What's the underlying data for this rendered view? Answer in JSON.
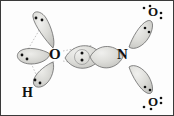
{
  "figure": {
    "kind": "orbital-overlap-diagram",
    "molecule": "HNO3",
    "background_color": "#fdfdfd",
    "border_color": "#3a3a3a",
    "lobe_fill": "#d8d8d4",
    "lobe_stroke": "#5a5a5a",
    "dot_color": "#111111",
    "guide_line_color": "#9a9a9a"
  },
  "atoms": [
    {
      "id": "oxygen-hydroxyl",
      "symbol": "O",
      "x": 55,
      "y": 54,
      "size": 15
    },
    {
      "id": "hydrogen",
      "symbol": "H",
      "x": 27,
      "y": 93,
      "size": 14
    },
    {
      "id": "nitrogen",
      "symbol": "N",
      "x": 121,
      "y": 51,
      "size": 15
    },
    {
      "id": "oxygen-top",
      "symbol": "O",
      "x": 150,
      "y": 10,
      "size": 13
    },
    {
      "id": "oxygen-bottom",
      "symbol": "O",
      "x": 150,
      "y": 94,
      "size": 13
    }
  ],
  "lobes": [
    {
      "id": "lobe-hydroxyl-upper",
      "label": "upper lone-pair lobe on hydroxyl oxygen"
    },
    {
      "id": "lobe-hydroxyl-left",
      "label": "left lone-pair lobe on hydroxyl oxygen"
    },
    {
      "id": "lobe-oh-bond",
      "label": "O-H bonding lobe"
    },
    {
      "id": "lobe-on-bond-left",
      "label": "O side of O-N sigma overlap"
    },
    {
      "id": "lobe-on-bond-right",
      "label": "N side of O-N sigma overlap"
    },
    {
      "id": "lobe-n-o-top",
      "label": "N to top oxygen bonding lobe"
    },
    {
      "id": "lobe-n-o-bottom",
      "label": "N to bottom oxygen bonding lobe"
    }
  ],
  "electron_pairs": [
    {
      "id": "pair-center-sigma",
      "location": "O-N sigma overlap center",
      "count": 2
    },
    {
      "id": "pair-hydroxyl-upper-lobe",
      "location": "upper lobe of hydroxyl oxygen",
      "count": 2
    },
    {
      "id": "pair-hydroxyl-left-lobe",
      "location": "left lobe of hydroxyl oxygen",
      "count": 2
    },
    {
      "id": "pair-oh-lobe",
      "location": "O-H bonding lobe",
      "count": 2
    },
    {
      "id": "pair-top-o-above",
      "location": "above top oxygen",
      "count": 2
    },
    {
      "id": "pair-top-o-right",
      "location": "right of top oxygen",
      "count": 2
    },
    {
      "id": "pair-top-o-lobe",
      "location": "top oxygen bonding lobe",
      "count": 2
    },
    {
      "id": "pair-bottom-o-below",
      "location": "below bottom oxygen",
      "count": 2
    },
    {
      "id": "pair-bottom-o-right",
      "location": "right of bottom oxygen",
      "count": 2
    },
    {
      "id": "pair-bottom-o-lobe",
      "location": "bottom oxygen bonding lobe",
      "count": 2
    }
  ],
  "guide_lines": [
    {
      "id": "guide-o-to-upper-lobe"
    },
    {
      "id": "guide-o-to-left-lobe"
    },
    {
      "id": "guide-o-to-h-lobe"
    },
    {
      "id": "guide-o-to-sigma-top"
    },
    {
      "id": "guide-o-to-sigma-bottom"
    }
  ]
}
